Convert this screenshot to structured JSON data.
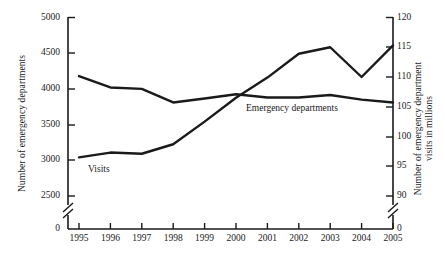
{
  "chart_data": {
    "type": "line",
    "title": "",
    "subtitle": "",
    "xlabel": "",
    "categories": [
      "1995",
      "1996",
      "1997",
      "1998",
      "1999",
      "2000",
      "2001",
      "2002",
      "2003",
      "2004",
      "2005"
    ],
    "x": [
      1995,
      1996,
      1997,
      1998,
      1999,
      2000,
      2001,
      2002,
      2003,
      2004,
      2005
    ],
    "grid": false,
    "legend_position": "inline-annotations",
    "axes": {
      "left": {
        "label": "Number of emergency departments",
        "ticks": [
          "5000",
          "4500",
          "4000",
          "3500",
          "3000",
          "2500",
          "0"
        ],
        "tick_values": [
          5000,
          4500,
          4000,
          3500,
          3000,
          2500,
          0
        ],
        "ylim": [
          2500,
          5000
        ],
        "broken_axis": true,
        "break_between": [
          0,
          2500
        ]
      },
      "right": {
        "label": "Number of emergency department visits in millions",
        "label_line1": "Number of emergency department",
        "label_line2": "visits in millions",
        "ticks": [
          "120",
          "115",
          "110",
          "105",
          "100",
          "95",
          "90",
          "0"
        ],
        "tick_values": [
          120,
          115,
          110,
          105,
          100,
          95,
          90,
          0
        ],
        "ylim": [
          90,
          120
        ],
        "broken_axis": true,
        "break_between": [
          0,
          90
        ]
      }
    },
    "series": [
      {
        "name": "Emergency departments",
        "axis": "left",
        "units": "departments",
        "label_text": "Emergency departments",
        "color": "#1a1a1a",
        "values": [
          4180,
          4020,
          4000,
          3810,
          3865,
          3925,
          3880,
          3880,
          3915,
          3850,
          3810
        ]
      },
      {
        "name": "Visits",
        "axis": "right",
        "units": "millions of visits",
        "label_text": "Visits",
        "color": "#1a1a1a",
        "values": [
          96.5,
          97.3,
          97.1,
          98.7,
          102.5,
          106.5,
          109.9,
          113.9,
          115.0,
          110.0,
          115.3
        ]
      }
    ],
    "annotations": [
      {
        "text": "Visits",
        "near_x": 1995.6,
        "placement": "below-line"
      },
      {
        "text": "Emergency departments",
        "near_x": 2001.5,
        "placement": "below-line"
      }
    ]
  },
  "axis_labels": {
    "left_title": "Number of emergency departments",
    "right_title_line1": "Number of emergency department",
    "right_title_line2": "visits in millions"
  },
  "series_labels": {
    "visits": "Visits",
    "emergency_departments": "Emergency departments"
  },
  "colors": {
    "line": "#1a1a1a",
    "axis": "#1a1a1a",
    "background": "#ffffff"
  }
}
